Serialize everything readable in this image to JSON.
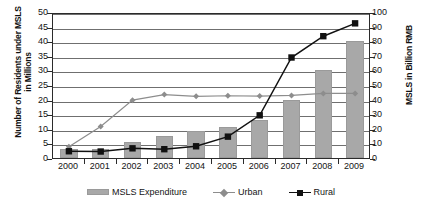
{
  "chart_data": {
    "type": "bar",
    "title": "",
    "xlabel": "",
    "ylabel": "Number of Residents under MSLS in Millions",
    "y2label": "MSLS in Billion RMB",
    "categories": [
      "2000",
      "2001",
      "2002",
      "2003",
      "2004",
      "2005",
      "2006",
      "2007",
      "2008",
      "2009"
    ],
    "ylim": [
      0,
      50
    ],
    "y2lim": [
      0,
      100
    ],
    "yticks": [
      0,
      5,
      10,
      15,
      20,
      25,
      30,
      35,
      40,
      45,
      50
    ],
    "y2ticks": [
      0,
      10,
      20,
      30,
      40,
      50,
      60,
      70,
      80,
      90,
      100
    ],
    "grid": true,
    "legend_position": "bottom",
    "series": [
      {
        "name": "MSLS Expenditure",
        "type": "bar",
        "axis": "right",
        "unit": "Billion RMB",
        "values": [
          6,
          6,
          11,
          15,
          18.5,
          21,
          26,
          40,
          60,
          80
        ]
      },
      {
        "name": "Urban",
        "type": "line",
        "marker": "diamond",
        "axis": "left",
        "unit": "Millions",
        "values": [
          4.5,
          11.5,
          20.5,
          22.4,
          21.8,
          22.0,
          21.9,
          22.1,
          22.8,
          22.8
        ]
      },
      {
        "name": "Rural",
        "type": "line",
        "marker": "square",
        "axis": "left",
        "unit": "Millions",
        "values": [
          3.0,
          2.9,
          4.0,
          3.7,
          4.7,
          8.0,
          15.3,
          35.1,
          42.4,
          46.8
        ]
      }
    ]
  },
  "axes": {
    "left_title": "Number of Residents under MSLS in Millions",
    "right_title": "MSLS in Billion RMB"
  },
  "legend": {
    "items": [
      {
        "label": "MSLS Expenditure",
        "marker": "bar-swatch",
        "color": "#a8a8a8"
      },
      {
        "label": "Urban",
        "marker": "diamond-marker",
        "color": "#8d8d8d"
      },
      {
        "label": "Rural",
        "marker": "square-marker",
        "color": "#111111"
      }
    ]
  },
  "caption": {
    "text": ""
  }
}
